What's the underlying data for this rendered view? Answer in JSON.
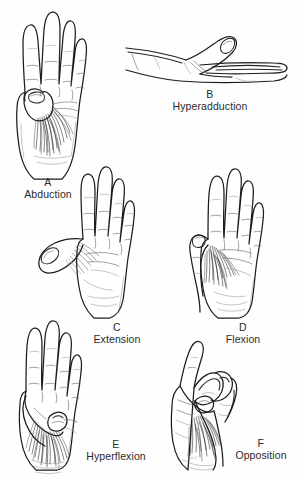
{
  "figure": {
    "background_color": "#fefefe",
    "ink_color": "#1d1d1d",
    "signature": "ııı.c"
  },
  "panels": [
    {
      "id": "A",
      "letter": "A",
      "name": "Abduction",
      "view": "palmar",
      "description": "Palm facing viewer, fingers together and extended, thumb drawn away from the palm plane"
    },
    {
      "id": "B",
      "letter": "B",
      "name": "Hyperadduction",
      "view": "radial-lateral",
      "description": "Hand seen edge-on, thumb carried across beyond the palm toward the little finger side"
    },
    {
      "id": "C",
      "letter": "C",
      "name": "Extension",
      "view": "palmar",
      "description": "Palm facing viewer, thumb carried laterally away in the plane of the palm"
    },
    {
      "id": "D",
      "letter": "D",
      "name": "Flexion",
      "view": "palmar",
      "description": "Palm facing viewer, thumb drawn medially across the palm"
    },
    {
      "id": "E",
      "letter": "E",
      "name": "Hyperflexion",
      "view": "palmar",
      "description": "Palm facing viewer, thumb flexed fully across the palm beneath the fingers"
    },
    {
      "id": "F",
      "letter": "F",
      "name": "Opposition",
      "view": "palmar-oblique",
      "description": "Thumb pad brought to meet the pads of the index and middle fingers"
    }
  ]
}
